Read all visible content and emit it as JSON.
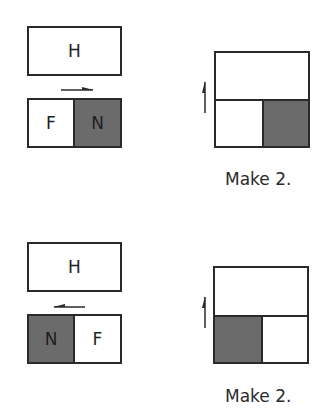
{
  "colors": {
    "shaded": "#6b6b6b",
    "outline": "#2a2a2a",
    "background": "#ffffff"
  },
  "panels": [
    {
      "top_block": {
        "label": "H"
      },
      "arrow": {
        "direction": "right"
      },
      "bottom_block": {
        "cells": [
          {
            "label": "F",
            "shaded": false
          },
          {
            "label": "N",
            "shaded": true
          }
        ]
      },
      "result": {
        "arrow": "up",
        "shaded_cell": "right",
        "caption": "Make 2."
      }
    },
    {
      "top_block": {
        "label": "H"
      },
      "arrow": {
        "direction": "left"
      },
      "bottom_block": {
        "cells": [
          {
            "label": "N",
            "shaded": true
          },
          {
            "label": "F",
            "shaded": false
          }
        ]
      },
      "result": {
        "arrow": "up",
        "shaded_cell": "left",
        "caption": "Make 2."
      }
    }
  ]
}
